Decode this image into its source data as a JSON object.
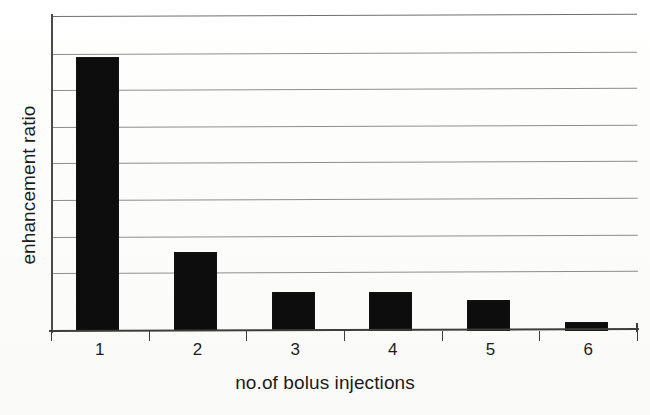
{
  "chart_data": {
    "type": "bar",
    "title": "",
    "xlabel": "no.of bolus injections",
    "ylabel": "enhancement ratio",
    "categories": [
      "1",
      "2",
      "3",
      "4",
      "5",
      "6"
    ],
    "values": [
      0.87,
      0.25,
      0.125,
      0.125,
      0.1,
      0.03
    ],
    "ylim": [
      0,
      1
    ],
    "xlim": [
      0,
      6
    ],
    "grid": true,
    "gridline_count": 8,
    "gridline_positions": [
      1.0,
      0.88,
      0.765,
      0.648,
      0.533,
      0.416,
      0.298,
      0.184
    ],
    "legend": "none",
    "series": [
      {
        "name": "enhancement ratio",
        "color": "#0d0d0d",
        "values": [
          0.87,
          0.25,
          0.125,
          0.125,
          0.1,
          0.03
        ]
      }
    ],
    "y_tick_labels": [],
    "annotations": []
  },
  "axis": {
    "x_tick_labels": [
      "1",
      "2",
      "3",
      "4",
      "5",
      "6"
    ],
    "x_title": "no.of bolus injections",
    "y_title": "enhancement ratio"
  },
  "colors": {
    "bar": "#0d0d0d",
    "gridline": "#8d8d8d",
    "axis": "#3d3d3d",
    "background": "#fdfdfc",
    "text": "#1b1b1b"
  }
}
